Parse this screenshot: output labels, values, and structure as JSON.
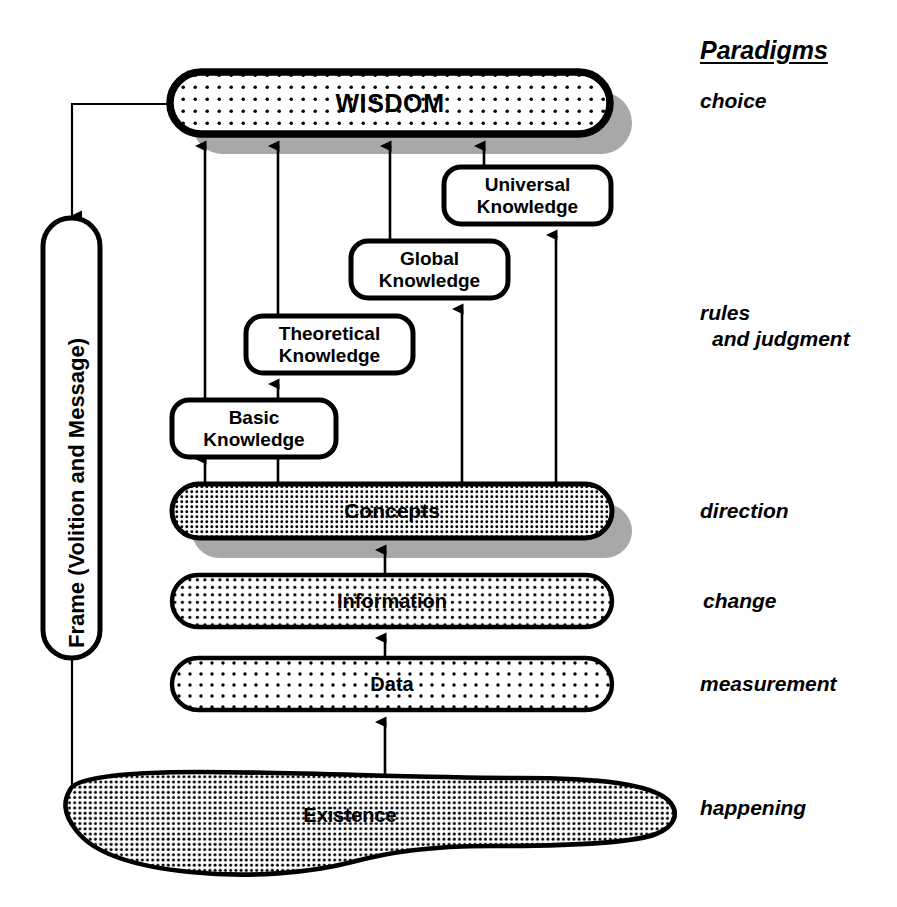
{
  "diagram": {
    "title_column": {
      "heading": "Paradigms",
      "labels": [
        {
          "text": "choice"
        },
        {
          "text": "rules"
        },
        {
          "text": "and judgment"
        },
        {
          "text": "direction"
        },
        {
          "text": "change"
        },
        {
          "text": "measurement"
        },
        {
          "text": "happening"
        }
      ]
    },
    "nodes": {
      "wisdom": {
        "label": "WISDOM"
      },
      "universal_knowledge": {
        "line1": "Universal",
        "line2": "Knowledge"
      },
      "global_knowledge": {
        "line1": "Global",
        "line2": "Knowledge"
      },
      "theoretical_knowledge": {
        "line1": "Theoretical",
        "line2": "Knowledge"
      },
      "basic_knowledge": {
        "line1": "Basic",
        "line2": "Knowledge"
      },
      "concepts": {
        "label": "Concepts"
      },
      "information": {
        "label": "Information"
      },
      "data": {
        "label": "Data"
      },
      "existence": {
        "label": "Existence"
      },
      "frame": {
        "label": "Frame (Volition and Message)"
      }
    },
    "colors": {
      "stroke": "#000000",
      "fill_white": "#ffffff",
      "shadow": "#a8a8a8",
      "dot": "#000000",
      "background": "#ffffff"
    }
  }
}
